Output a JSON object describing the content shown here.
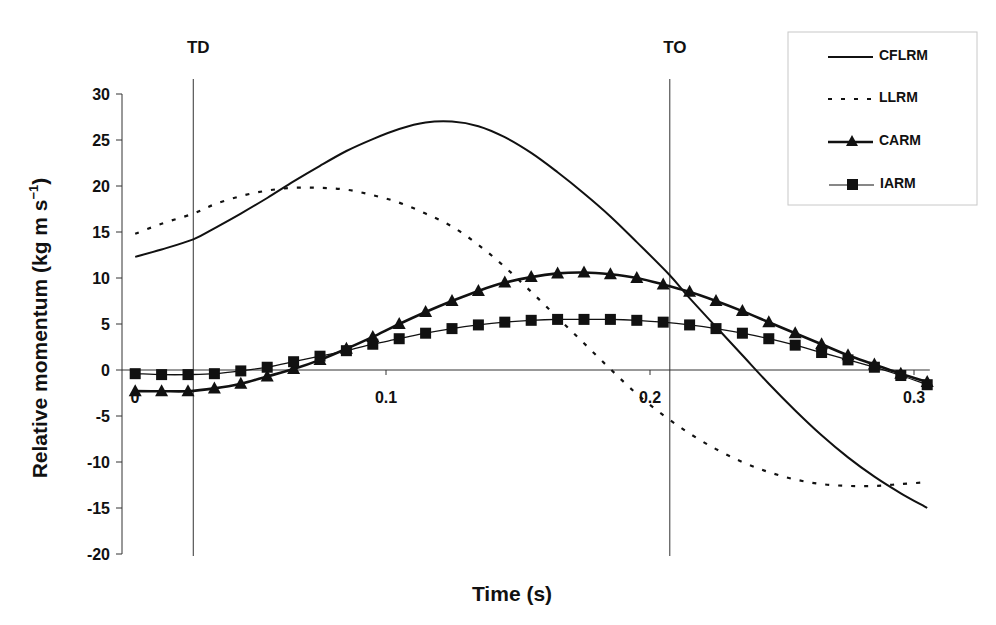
{
  "chart_data": {
    "type": "line",
    "title": "",
    "xlabel": "Time (s)",
    "ylabel": "Relative momentum (kg m s⁻¹)",
    "ylabel_main": "Relative momentum (kg m s",
    "ylabel_sup": "−1",
    "ylabel_close": ")",
    "xlim": [
      0,
      0.3
    ],
    "ylim": [
      -20,
      30
    ],
    "xticks": [
      0,
      0.1,
      0.2,
      0.3
    ],
    "xtick_labels": [
      "0",
      "0.1",
      "0.2",
      "0.3"
    ],
    "yticks": [
      30,
      25,
      20,
      15,
      10,
      5,
      0,
      -5,
      -10,
      -15,
      -20
    ],
    "ytick_labels": [
      "30",
      "25",
      "20",
      "15",
      "10",
      "5",
      "0",
      "-5",
      "-10",
      "-15",
      "-20"
    ],
    "grid": false,
    "legend_position": "upper right",
    "annotations": [
      {
        "label": "TD",
        "x": 0.027,
        "type": "vertical-line"
      },
      {
        "label": "TO",
        "x": 0.2075,
        "type": "vertical-line"
      }
    ],
    "series": [
      {
        "name": "CFLRM",
        "style": "solid",
        "marker": "none",
        "x": [
          0.005,
          0.015,
          0.027,
          0.035,
          0.045,
          0.055,
          0.065,
          0.075,
          0.085,
          0.095,
          0.105,
          0.115,
          0.125,
          0.135,
          0.145,
          0.155,
          0.165,
          0.175,
          0.185,
          0.195,
          0.2075,
          0.215,
          0.225,
          0.235,
          0.245,
          0.255,
          0.265,
          0.275,
          0.285,
          0.295,
          0.305
        ],
        "values": [
          12.3,
          13.1,
          14.2,
          15.4,
          17.0,
          18.7,
          20.5,
          22.2,
          23.8,
          25.1,
          26.2,
          26.9,
          27.0,
          26.5,
          25.3,
          23.6,
          21.5,
          19.2,
          16.7,
          13.9,
          10.3,
          7.8,
          4.7,
          1.6,
          -1.5,
          -4.4,
          -7.1,
          -9.5,
          -11.6,
          -13.4,
          -15.0
        ]
      },
      {
        "name": "LLRM",
        "style": "dotted",
        "marker": "none",
        "x": [
          0.005,
          0.015,
          0.027,
          0.035,
          0.045,
          0.055,
          0.065,
          0.075,
          0.085,
          0.095,
          0.105,
          0.115,
          0.125,
          0.135,
          0.145,
          0.155,
          0.165,
          0.175,
          0.185,
          0.195,
          0.205,
          0.215,
          0.225,
          0.235,
          0.245,
          0.255,
          0.265,
          0.275,
          0.285,
          0.295,
          0.305
        ],
        "values": [
          14.8,
          15.9,
          17.0,
          18.0,
          18.9,
          19.5,
          19.8,
          19.8,
          19.6,
          19.0,
          18.2,
          17.0,
          15.6,
          13.6,
          11.2,
          8.5,
          5.7,
          2.9,
          0.1,
          -2.6,
          -4.9,
          -6.9,
          -8.6,
          -10.0,
          -11.1,
          -11.9,
          -12.4,
          -12.6,
          -12.6,
          -12.4,
          -12.2
        ]
      },
      {
        "name": "CARM",
        "style": "solid-bold",
        "marker": "triangle",
        "x": [
          0.005,
          0.015,
          0.025,
          0.035,
          0.045,
          0.055,
          0.065,
          0.075,
          0.085,
          0.095,
          0.105,
          0.115,
          0.125,
          0.135,
          0.145,
          0.155,
          0.165,
          0.175,
          0.185,
          0.195,
          0.205,
          0.215,
          0.225,
          0.235,
          0.245,
          0.255,
          0.265,
          0.275,
          0.285,
          0.295,
          0.305
        ],
        "values": [
          -2.3,
          -2.3,
          -2.3,
          -2.0,
          -1.5,
          -0.7,
          0.1,
          1.1,
          2.3,
          3.6,
          5.0,
          6.3,
          7.5,
          8.6,
          9.5,
          10.1,
          10.5,
          10.6,
          10.4,
          10.0,
          9.3,
          8.5,
          7.5,
          6.4,
          5.2,
          4.0,
          2.8,
          1.6,
          0.6,
          -0.4,
          -1.3
        ]
      },
      {
        "name": "IARM",
        "style": "solid-thin",
        "marker": "square",
        "x": [
          0.005,
          0.015,
          0.025,
          0.035,
          0.045,
          0.055,
          0.065,
          0.075,
          0.085,
          0.095,
          0.105,
          0.115,
          0.125,
          0.135,
          0.145,
          0.155,
          0.165,
          0.175,
          0.185,
          0.195,
          0.205,
          0.215,
          0.225,
          0.235,
          0.245,
          0.255,
          0.265,
          0.275,
          0.285,
          0.295,
          0.305
        ],
        "values": [
          -0.4,
          -0.5,
          -0.5,
          -0.4,
          -0.1,
          0.3,
          0.9,
          1.5,
          2.1,
          2.8,
          3.4,
          4.0,
          4.5,
          4.9,
          5.2,
          5.4,
          5.5,
          5.5,
          5.5,
          5.4,
          5.2,
          4.9,
          4.5,
          4.0,
          3.4,
          2.7,
          1.9,
          1.1,
          0.3,
          -0.6,
          -1.6
        ]
      }
    ]
  },
  "legend": {
    "items": [
      {
        "label": "CFLRM"
      },
      {
        "label": "LLRM"
      },
      {
        "label": "CARM"
      },
      {
        "label": "IARM"
      }
    ]
  },
  "colors": {
    "line": "#111111",
    "axis": "#333333",
    "legend_border": "#c8c8c8"
  }
}
